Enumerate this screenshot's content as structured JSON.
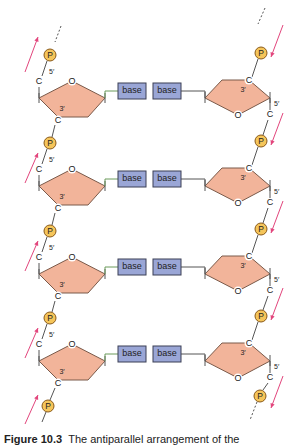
{
  "figure": {
    "caption_label": "Figure 10.3",
    "caption_text": "The antiparallel arrangement of the"
  },
  "colors": {
    "sugar_fill": "#f2b49a",
    "sugar_stroke": "#7a5a4a",
    "base_fill": "#9aa6d6",
    "base_stroke": "#3b3f55",
    "phosphate_fill": "#f5c55a",
    "phosphate_stroke": "#8a5a1a",
    "arrow": "#e2457c",
    "backbone": "#555555",
    "linker_green": "#6a9a5a"
  },
  "labels": {
    "base": "base",
    "phosphate": "P",
    "carbon": "C",
    "oxygen": "O",
    "five_prime": "5′",
    "three_prime": "3′"
  },
  "rows": [
    {
      "index": 0,
      "y": 75
    },
    {
      "index": 1,
      "y": 163
    },
    {
      "index": 2,
      "y": 251
    },
    {
      "index": 3,
      "y": 338
    }
  ],
  "strands": {
    "left": {
      "direction": "up",
      "orientation": "5′→3′ upward"
    },
    "right": {
      "direction": "down",
      "orientation": "5′→3′ downward"
    }
  }
}
